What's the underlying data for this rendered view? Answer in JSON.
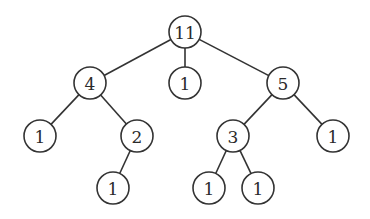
{
  "diagram": {
    "type": "tree",
    "style": {
      "stroke_color": "#333333",
      "fill_color": "#ffffff",
      "text_color": "#2a2a2a",
      "node_radius": 16
    },
    "nodes": [
      {
        "id": "n0",
        "label": "11",
        "x": 185,
        "y": 32
      },
      {
        "id": "n1",
        "label": "4",
        "x": 90,
        "y": 83
      },
      {
        "id": "n2",
        "label": "1",
        "x": 185,
        "y": 83
      },
      {
        "id": "n3",
        "label": "5",
        "x": 283,
        "y": 83
      },
      {
        "id": "n4",
        "label": "1",
        "x": 40,
        "y": 136
      },
      {
        "id": "n5",
        "label": "2",
        "x": 137,
        "y": 136
      },
      {
        "id": "n6",
        "label": "3",
        "x": 233,
        "y": 136
      },
      {
        "id": "n7",
        "label": "1",
        "x": 333,
        "y": 136
      },
      {
        "id": "n8",
        "label": "1",
        "x": 113,
        "y": 188
      },
      {
        "id": "n9",
        "label": "1",
        "x": 209,
        "y": 188
      },
      {
        "id": "n10",
        "label": "1",
        "x": 258,
        "y": 188
      }
    ],
    "edges": [
      {
        "from": "n0",
        "to": "n1"
      },
      {
        "from": "n0",
        "to": "n2"
      },
      {
        "from": "n0",
        "to": "n3"
      },
      {
        "from": "n1",
        "to": "n4"
      },
      {
        "from": "n1",
        "to": "n5"
      },
      {
        "from": "n3",
        "to": "n6"
      },
      {
        "from": "n3",
        "to": "n7"
      },
      {
        "from": "n5",
        "to": "n8"
      },
      {
        "from": "n6",
        "to": "n9"
      },
      {
        "from": "n6",
        "to": "n10"
      }
    ]
  }
}
